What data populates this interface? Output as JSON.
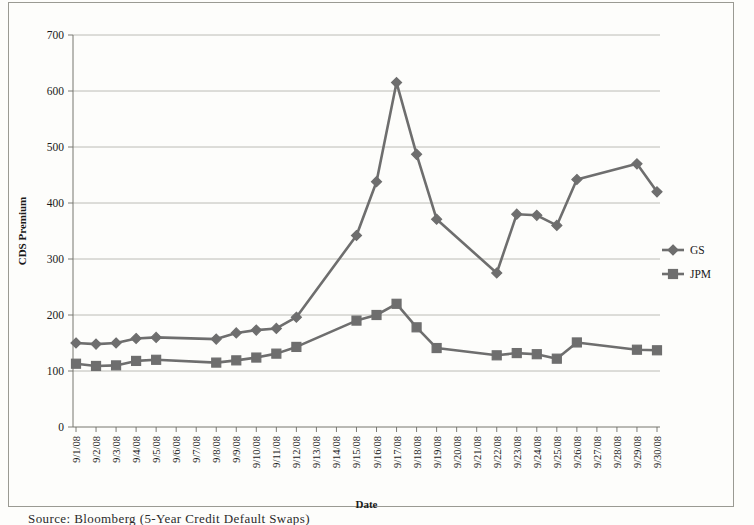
{
  "caption": "Source:  Bloomberg  (5-Year  Credit  Default  Swaps)",
  "chart_data": {
    "type": "line",
    "title": "",
    "xlabel": "Date",
    "ylabel": "CDS Premium",
    "ylim": [
      0,
      700
    ],
    "ytick_step": 100,
    "yticks": [
      "0",
      "100",
      "200",
      "300",
      "400",
      "500",
      "600",
      "700"
    ],
    "grid": true,
    "legend_position": "right",
    "categories": [
      "9/1/08",
      "9/2/08",
      "9/3/08",
      "9/4/08",
      "9/5/08",
      "9/6/08",
      "9/7/08",
      "9/8/08",
      "9/9/08",
      "9/10/08",
      "9/11/08",
      "9/12/08",
      "9/13/08",
      "9/14/08",
      "9/15/08",
      "9/16/08",
      "9/17/08",
      "9/18/08",
      "9/19/08",
      "9/20/08",
      "9/21/08",
      "9/22/08",
      "9/23/08",
      "9/24/08",
      "9/25/08",
      "9/26/08",
      "9/27/08",
      "9/28/08",
      "9/29/08",
      "9/30/08"
    ],
    "series": [
      {
        "name": "GS",
        "marker": "diamond",
        "color": "#6e6e6e",
        "values": [
          150,
          148,
          150,
          158,
          160,
          null,
          null,
          157,
          168,
          173,
          176,
          196,
          null,
          null,
          342,
          438,
          615,
          487,
          371,
          null,
          null,
          275,
          380,
          378,
          360,
          442,
          null,
          null,
          470,
          420
        ]
      },
      {
        "name": "JPM",
        "marker": "square",
        "color": "#6e6e6e",
        "values": [
          113,
          109,
          110,
          118,
          120,
          null,
          null,
          115,
          119,
          124,
          131,
          143,
          null,
          null,
          190,
          200,
          220,
          178,
          141,
          null,
          null,
          128,
          132,
          130,
          122,
          151,
          null,
          null,
          138,
          137
        ]
      }
    ]
  }
}
